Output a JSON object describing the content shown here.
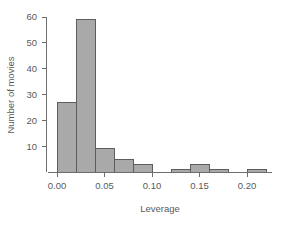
{
  "chart_data": {
    "type": "bar",
    "title": "",
    "subtitle": "",
    "xlabel": "Leverage",
    "ylabel": "Number of movies",
    "grid": false,
    "legend": false,
    "legend_position": "none",
    "bin_width": 0.02,
    "xlim": [
      0.0,
      0.224
    ],
    "ylim": [
      0,
      60
    ],
    "xticks": [
      0.0,
      0.05,
      0.1,
      0.15,
      0.2
    ],
    "xtick_labels": [
      "0.00",
      "0.05",
      "0.10",
      "0.15",
      "0.20"
    ],
    "yticks": [
      10,
      20,
      30,
      40,
      50,
      60
    ],
    "ytick_labels": [
      "10",
      "20",
      "30",
      "40",
      "50",
      "60"
    ],
    "bar_fill_color": "#a9a9a9",
    "bar_edge_color": "#5d5d5d",
    "axis_color": "#6e6e6e",
    "text_color": "#5a5a5a",
    "bins": [
      {
        "x0": 0.0,
        "x1": 0.02,
        "count": 27
      },
      {
        "x0": 0.02,
        "x1": 0.04,
        "count": 59
      },
      {
        "x0": 0.04,
        "x1": 0.06,
        "count": 9
      },
      {
        "x0": 0.06,
        "x1": 0.08,
        "count": 5
      },
      {
        "x0": 0.08,
        "x1": 0.1,
        "count": 3
      },
      {
        "x0": 0.1,
        "x1": 0.12,
        "count": 0
      },
      {
        "x0": 0.12,
        "x1": 0.14,
        "count": 1
      },
      {
        "x0": 0.14,
        "x1": 0.16,
        "count": 3
      },
      {
        "x0": 0.16,
        "x1": 0.18,
        "count": 1
      },
      {
        "x0": 0.18,
        "x1": 0.2,
        "count": 0
      },
      {
        "x0": 0.2,
        "x1": 0.22,
        "count": 1
      }
    ],
    "categories": [
      "0.00-0.02",
      "0.02-0.04",
      "0.04-0.06",
      "0.06-0.08",
      "0.08-0.10",
      "0.10-0.12",
      "0.12-0.14",
      "0.14-0.16",
      "0.16-0.18",
      "0.18-0.20",
      "0.20-0.22"
    ],
    "values": [
      27,
      59,
      9,
      5,
      3,
      0,
      1,
      3,
      1,
      0,
      1
    ]
  }
}
